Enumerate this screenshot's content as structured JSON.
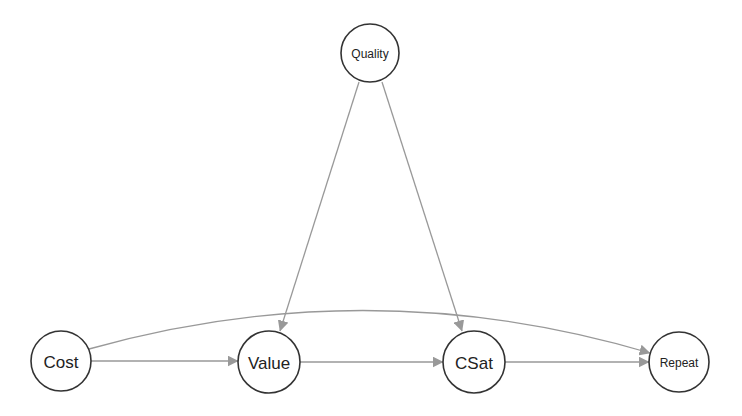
{
  "diagram": {
    "type": "directed-acyclic-graph",
    "colors": {
      "background": "#ffffff",
      "node_stroke": "#333333",
      "node_fill": "#ffffff",
      "edge": "#999999",
      "label": "#222222"
    },
    "nodes": [
      {
        "id": "quality",
        "label": "Quality",
        "cx": 370,
        "cy": 53,
        "r": 29,
        "font_size": 12
      },
      {
        "id": "cost",
        "label": "Cost",
        "cx": 61,
        "cy": 361,
        "r": 30,
        "font_size": 17
      },
      {
        "id": "value",
        "label": "Value",
        "cx": 269,
        "cy": 362,
        "r": 31,
        "font_size": 17
      },
      {
        "id": "csat",
        "label": "CSat",
        "cx": 474,
        "cy": 362,
        "r": 31,
        "font_size": 17
      },
      {
        "id": "repeat",
        "label": "Repeat",
        "cx": 679,
        "cy": 362,
        "r": 30,
        "font_size": 12
      }
    ],
    "edges": [
      {
        "from": "quality",
        "to": "value",
        "curved": false
      },
      {
        "from": "quality",
        "to": "csat",
        "curved": false
      },
      {
        "from": "cost",
        "to": "value",
        "curved": false
      },
      {
        "from": "value",
        "to": "csat",
        "curved": false
      },
      {
        "from": "csat",
        "to": "repeat",
        "curved": false
      },
      {
        "from": "cost",
        "to": "repeat",
        "curved": true
      }
    ]
  }
}
